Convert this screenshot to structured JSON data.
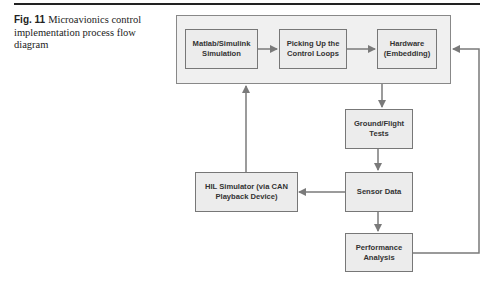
{
  "caption": {
    "label": "Fig. 11",
    "text": "Microavionics control implementation process flow diagram"
  },
  "nodes": {
    "matlab": {
      "line1": "Matlab/Simulink",
      "line2": "Simulation"
    },
    "picking": {
      "line1": "Picking Up the",
      "line2": "Control Loops"
    },
    "hardware": {
      "line1": "Hardware",
      "line2": "(Embedding)"
    },
    "ground": {
      "line1": "Ground/Flight",
      "line2": "Tests"
    },
    "sensor": {
      "line1": "Sensor Data",
      "line2": ""
    },
    "hil": {
      "line1": "HIL Simulator (via CAN",
      "line2": "Playback Device)"
    },
    "performance": {
      "line1": "Performance",
      "line2": "Analysis"
    }
  },
  "edges": [
    {
      "from": "matlab",
      "to": "picking"
    },
    {
      "from": "picking",
      "to": "hardware"
    },
    {
      "from": "hardware",
      "to": "ground"
    },
    {
      "from": "ground",
      "to": "sensor"
    },
    {
      "from": "sensor",
      "to": "hil"
    },
    {
      "from": "sensor",
      "to": "performance"
    },
    {
      "from": "hil",
      "to": "outer-group"
    },
    {
      "from": "performance",
      "to": "hardware"
    }
  ],
  "colors": {
    "line": "#7a7a7a",
    "box_fill": "#ececec",
    "box_border": "#777777"
  }
}
